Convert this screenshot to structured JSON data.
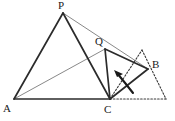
{
  "figure": {
    "background": "#ffffff",
    "stroke_dark": "#2b2b2b",
    "stroke_thin": "#7a7a7a",
    "stroke_dotted": "#3a3a3a",
    "canvas": {
      "width": 175,
      "height": 121
    }
  },
  "labels": {
    "p": "P",
    "q": "Q",
    "a": "A",
    "b": "B",
    "c": "C"
  },
  "points": {
    "P": {
      "x": 63,
      "y": 13
    },
    "Q": {
      "x": 105,
      "y": 49
    },
    "A": {
      "x": 14,
      "y": 99
    },
    "B": {
      "x": 148,
      "y": 69
    },
    "C": {
      "x": 110,
      "y": 99
    },
    "D_apex": {
      "x": 142,
      "y": 50
    },
    "E_right": {
      "x": 166,
      "y": 99
    }
  },
  "label_positions": {
    "P": {
      "x": 58,
      "y": 1
    },
    "Q": {
      "x": 95,
      "y": 37
    },
    "A": {
      "x": 3,
      "y": 104
    },
    "B": {
      "x": 152,
      "y": 60
    },
    "C": {
      "x": 105,
      "y": 106
    }
  },
  "segments": {
    "thick": [
      {
        "name": "A-P",
        "from": "A",
        "to": "P"
      },
      {
        "name": "P-C",
        "from": "P",
        "to": "C"
      },
      {
        "name": "A-C",
        "from": "A",
        "to": "C"
      },
      {
        "name": "Q-C",
        "from": "Q",
        "to": "C"
      },
      {
        "name": "Q-B",
        "from": "Q",
        "to": "B"
      },
      {
        "name": "B-C",
        "from": "B",
        "to": "C"
      }
    ],
    "thin": [
      {
        "name": "A-Q",
        "from": "A",
        "to": "Q"
      },
      {
        "name": "P-B",
        "from": "P",
        "to": "B"
      }
    ],
    "dotted": [
      {
        "name": "C-Dapex",
        "from": "C",
        "to": "D_apex"
      },
      {
        "name": "Dapex-Eright",
        "from": "D_apex",
        "to": "E_right"
      },
      {
        "name": "C-Eright",
        "from": "C",
        "to": "E_right"
      }
    ]
  },
  "arrow": {
    "name": "rotation-arrow",
    "path": "M 133 93 Q 126 84 117 73",
    "head_tip": {
      "x": 115,
      "y": 71
    }
  }
}
